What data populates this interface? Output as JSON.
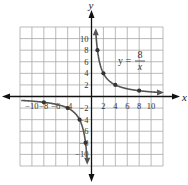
{
  "chart_data": {
    "type": "line",
    "title": "",
    "equation": {
      "lhs": "y =",
      "numerator": "8",
      "denominator": "x"
    },
    "xlabel": "x",
    "ylabel": "y",
    "xlim": [
      -12,
      12
    ],
    "ylim": [
      -12,
      12
    ],
    "grid": true,
    "grid_step": 2,
    "x_ticks": [
      -10,
      -8,
      -6,
      -4,
      2,
      4,
      6,
      8,
      10
    ],
    "y_ticks": [
      10,
      8,
      6,
      4,
      2,
      -2,
      -4,
      -6,
      -8,
      -10
    ],
    "series": [
      {
        "name": "y = 8/x",
        "points": [
          [
            1,
            8
          ],
          [
            2,
            4
          ],
          [
            4,
            2
          ],
          [
            8,
            1
          ],
          [
            -1,
            -8
          ],
          [
            -2,
            -4
          ],
          [
            -4,
            -2
          ],
          [
            -8,
            -1
          ]
        ]
      }
    ],
    "colors": {
      "curve": "#555555",
      "grid": "#a8a8a8",
      "axes": "#111111"
    }
  }
}
